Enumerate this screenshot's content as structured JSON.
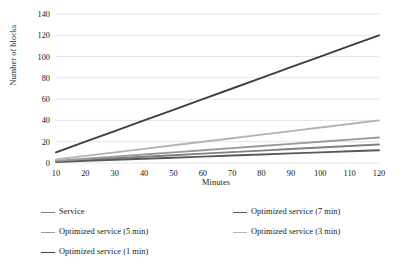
{
  "chart_data": {
    "type": "line",
    "title": "",
    "xlabel": "Minutes",
    "ylabel": "Number of blocks",
    "x": [
      10,
      20,
      30,
      40,
      50,
      60,
      70,
      80,
      90,
      100,
      110,
      120
    ],
    "xlim": [
      10,
      120
    ],
    "ylim": [
      0,
      140
    ],
    "xticks": [
      "10",
      "20",
      "30",
      "40",
      "50",
      "60",
      "70",
      "80",
      "90",
      "100",
      "110",
      "120"
    ],
    "yticks": [
      "0",
      "20",
      "40",
      "60",
      "80",
      "100",
      "120",
      "140"
    ],
    "grid": "horizontal",
    "legend_position": "bottom",
    "series": [
      {
        "name": "Service",
        "color": "#808080",
        "values": [
          1.5,
          3.0,
          4.4,
          5.9,
          7.3,
          8.8,
          10.2,
          11.6,
          13.1,
          14.5,
          16.0,
          17.4
        ]
      },
      {
        "name": "Optimized service (7 min)",
        "color": "#595959",
        "values": [
          1.0,
          2.0,
          3.0,
          4.0,
          5.0,
          6.0,
          7.0,
          8.0,
          9.0,
          10.0,
          11.0,
          12.0
        ]
      },
      {
        "name": "Optimized service (5 min)",
        "color": "#999999",
        "values": [
          2.0,
          4.0,
          6.0,
          8.0,
          10.0,
          12.0,
          14.0,
          16.0,
          18.0,
          20.0,
          22.0,
          24.0
        ]
      },
      {
        "name": "Optimized service (3 min)",
        "color": "#b3b3b3",
        "values": [
          3.3,
          6.7,
          10.0,
          13.3,
          16.7,
          20.0,
          23.3,
          26.7,
          30.0,
          33.3,
          36.7,
          40.0
        ]
      },
      {
        "name": "Optimized service (1 min)",
        "color": "#3f3f3f",
        "values": [
          10.0,
          20.0,
          30.0,
          40.0,
          50.0,
          60.0,
          70.0,
          80.0,
          90.0,
          100.0,
          110.0,
          120.0
        ]
      }
    ],
    "legend_order": [
      {
        "series_index": 0,
        "column": 0,
        "row": 0
      },
      {
        "series_index": 1,
        "column": 1,
        "row": 0
      },
      {
        "series_index": 2,
        "column": 0,
        "row": 1
      },
      {
        "series_index": 3,
        "column": 1,
        "row": 1
      },
      {
        "series_index": 4,
        "column": 0,
        "row": 2
      }
    ],
    "gridline_color": "#d9d9d9",
    "text_color": "#1a1a1a"
  }
}
